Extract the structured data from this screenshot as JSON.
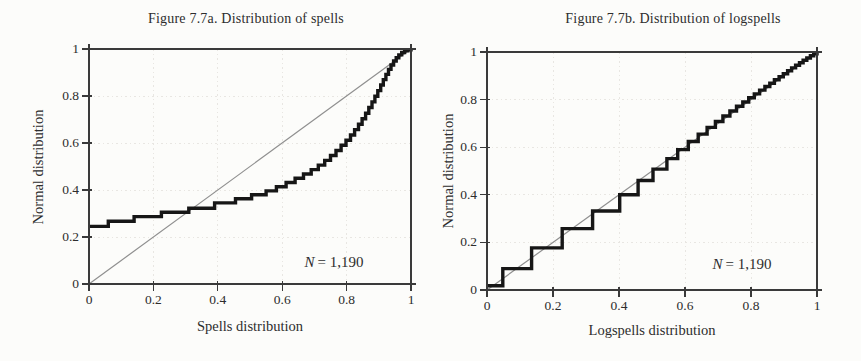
{
  "figure_type": "side-by-side P-P plots (scanned statistics figure)",
  "colors": {
    "background": "#fcfcfa",
    "text": "#2d2d2d",
    "frame": "#3a3a3a",
    "grid": "#e8e6e2",
    "reference_line": "#8f8f8f",
    "curve": "#161616"
  },
  "chart_data": [
    {
      "type": "line",
      "subtype": "P-P plot step function vs 45-degree reference line",
      "title": "Figure 7.7a. Distribution of spells",
      "xlabel": "Spells distribution",
      "ylabel": "Normal distribution",
      "annotation": {
        "var": "N",
        "rest": "= 1,190",
        "text": "N = 1,190"
      },
      "xlim": [
        0,
        1
      ],
      "ylim": [
        0,
        1
      ],
      "xticks": [
        0,
        0.2,
        0.4,
        0.6,
        0.8,
        1
      ],
      "yticks": [
        0,
        0.2,
        0.4,
        0.6,
        0.8,
        1
      ],
      "xtick_labels": [
        "0",
        "0.2",
        "0.4",
        "0.6",
        "0.8",
        "1"
      ],
      "ytick_labels": [
        "0",
        "0.2",
        "0.4",
        "0.6",
        "0.8",
        "1"
      ],
      "grid": "dotted, every 0.2",
      "legend": null,
      "reference_line": [
        [
          0,
          0
        ],
        [
          1,
          1
        ]
      ],
      "series": [
        {
          "name": "spells empirical vs normal",
          "style": "step",
          "points": [
            [
              0.0,
              0.245
            ],
            [
              0.06,
              0.267
            ],
            [
              0.14,
              0.287
            ],
            [
              0.225,
              0.305
            ],
            [
              0.31,
              0.322
            ],
            [
              0.39,
              0.345
            ],
            [
              0.455,
              0.363
            ],
            [
              0.505,
              0.38
            ],
            [
              0.55,
              0.396
            ],
            [
              0.582,
              0.414
            ],
            [
              0.612,
              0.432
            ],
            [
              0.64,
              0.45
            ],
            [
              0.666,
              0.468
            ],
            [
              0.69,
              0.487
            ],
            [
              0.712,
              0.506
            ],
            [
              0.732,
              0.526
            ],
            [
              0.75,
              0.547
            ],
            [
              0.767,
              0.568
            ],
            [
              0.783,
              0.59
            ],
            [
              0.798,
              0.612
            ],
            [
              0.812,
              0.634
            ],
            [
              0.825,
              0.657
            ],
            [
              0.837,
              0.68
            ],
            [
              0.848,
              0.703
            ],
            [
              0.859,
              0.727
            ],
            [
              0.869,
              0.751
            ],
            [
              0.879,
              0.775
            ],
            [
              0.888,
              0.799
            ],
            [
              0.897,
              0.823
            ],
            [
              0.906,
              0.847
            ],
            [
              0.914,
              0.87
            ],
            [
              0.922,
              0.892
            ],
            [
              0.93,
              0.913
            ],
            [
              0.938,
              0.932
            ],
            [
              0.946,
              0.949
            ],
            [
              0.954,
              0.963
            ],
            [
              0.962,
              0.975
            ],
            [
              0.971,
              0.985
            ],
            [
              0.98,
              0.992
            ],
            [
              0.99,
              0.997
            ],
            [
              1.0,
              1.0
            ]
          ]
        }
      ]
    },
    {
      "type": "line",
      "subtype": "P-P plot step function vs 45-degree reference line",
      "title": "Figure 7.7b. Distribution of logspells",
      "xlabel": "Logspells distribution",
      "ylabel": "Normal distribution",
      "annotation": {
        "var": "N",
        "rest": "= 1,190",
        "text": "N = 1,190"
      },
      "xlim": [
        0,
        1
      ],
      "ylim": [
        0,
        1
      ],
      "xticks": [
        0,
        0.2,
        0.4,
        0.6,
        0.8,
        1
      ],
      "yticks": [
        0,
        0.2,
        0.4,
        0.6,
        0.8,
        1
      ],
      "xtick_labels": [
        "0",
        "0.2",
        "0.4",
        "0.6",
        "0.8",
        "1"
      ],
      "ytick_labels": [
        "0",
        "0.2",
        "0.4",
        "0.6",
        "0.8",
        "1"
      ],
      "grid": "dotted, every 0.2",
      "legend": null,
      "reference_line": [
        [
          0,
          0
        ],
        [
          1,
          1
        ]
      ],
      "series": [
        {
          "name": "logspells empirical vs normal",
          "style": "step",
          "points": [
            [
              0.0,
              0.018
            ],
            [
              0.048,
              0.09
            ],
            [
              0.135,
              0.177
            ],
            [
              0.228,
              0.258
            ],
            [
              0.32,
              0.332
            ],
            [
              0.402,
              0.4
            ],
            [
              0.458,
              0.46
            ],
            [
              0.503,
              0.508
            ],
            [
              0.545,
              0.552
            ],
            [
              0.578,
              0.59
            ],
            [
              0.61,
              0.624
            ],
            [
              0.64,
              0.655
            ],
            [
              0.667,
              0.683
            ],
            [
              0.692,
              0.708
            ],
            [
              0.715,
              0.731
            ],
            [
              0.736,
              0.752
            ],
            [
              0.756,
              0.772
            ],
            [
              0.775,
              0.79
            ],
            [
              0.793,
              0.808
            ],
            [
              0.81,
              0.824
            ],
            [
              0.826,
              0.84
            ],
            [
              0.842,
              0.855
            ],
            [
              0.857,
              0.869
            ],
            [
              0.871,
              0.883
            ],
            [
              0.885,
              0.896
            ],
            [
              0.898,
              0.909
            ],
            [
              0.911,
              0.921
            ],
            [
              0.923,
              0.933
            ],
            [
              0.935,
              0.944
            ],
            [
              0.947,
              0.955
            ],
            [
              0.958,
              0.965
            ],
            [
              0.969,
              0.975
            ],
            [
              0.98,
              0.984
            ],
            [
              0.99,
              0.992
            ],
            [
              1.0,
              1.0
            ]
          ]
        }
      ]
    }
  ]
}
